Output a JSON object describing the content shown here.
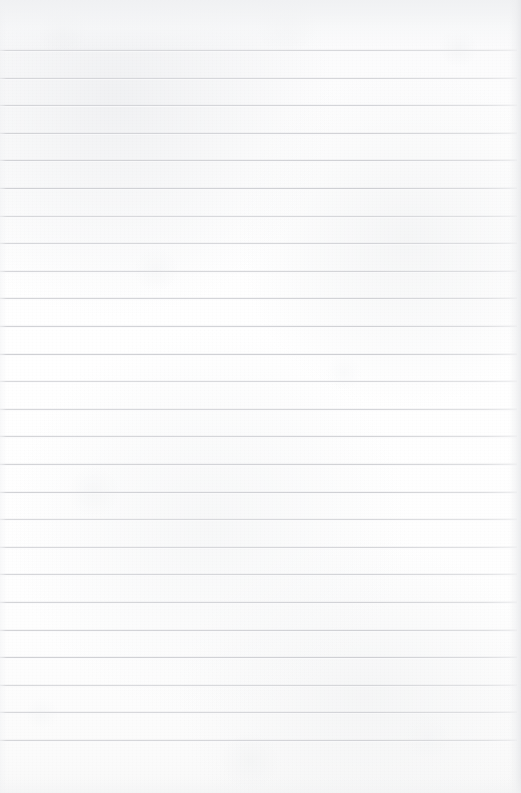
{
  "document": {
    "kind": "scanned-lined-paper",
    "title": "Blank Ruled Notebook Page",
    "content_text": "",
    "has_handwriting": false,
    "has_printed_text": false,
    "orientation": "portrait"
  },
  "page": {
    "width": 521,
    "height": 793,
    "background_color": "#fdfdfd",
    "top_band_color": "#f0f1f3",
    "top_margin": 50,
    "bottom_margin": 53
  },
  "ruling": {
    "line_color": "#d1d2d6",
    "line_thickness": 1,
    "line_spacing": 27.6,
    "first_line_y": 50,
    "last_line_y": 740,
    "line_count": 26,
    "left_inset": 0,
    "right_inset": 4,
    "lines_y": [
      50,
      77.6,
      105.2,
      132.8,
      160.4,
      188,
      215.6,
      243.2,
      270.8,
      298.4,
      326,
      353.6,
      381.2,
      408.8,
      436.4,
      464,
      491.6,
      519.2,
      546.8,
      574.4,
      602,
      629.6,
      657.2,
      684.8,
      712.4,
      740
    ]
  },
  "artifacts": {
    "right_edge_shadow": true,
    "left_edge_shadow": true,
    "paper_texture": "mottled-grain",
    "margin_rule": false
  }
}
